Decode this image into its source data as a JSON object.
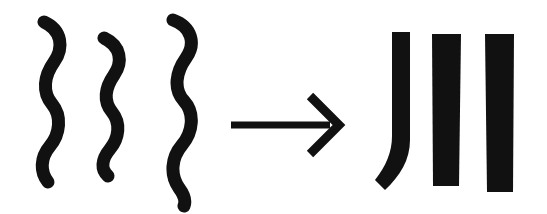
{
  "figure": {
    "title": "Wavy lines transform into straight bars",
    "background_color": "#ffffff",
    "ink_color": "#111111",
    "width": 547,
    "height": 214
  },
  "left_group": {
    "label": "Three wavy vertical lines",
    "count": 3,
    "stroke_color": "#111111",
    "items": [
      {
        "name": "wavy-line-1",
        "label": "Wavy line 1",
        "stroke_width": 13,
        "path": "M 44 22 C 62 30 64 48 54 62 C 44 76 42 92 52 104 C 62 116 60 134 50 146 C 40 158 40 172 48 182"
      },
      {
        "name": "wavy-line-2",
        "label": "Wavy line 2",
        "stroke_width": 13,
        "path": "M 104 38 C 121 46 123 62 114 75 C 105 88 103 101 112 112 C 121 123 119 138 110 149 C 101 160 101 170 108 176"
      },
      {
        "name": "wavy-line-3",
        "label": "Wavy line 3",
        "stroke_width": 13,
        "path": "M 173 20 C 192 27 196 44 186 58 C 176 72 173 89 184 101 C 195 113 193 132 182 145 C 171 158 170 175 179 188 C 185 196 186 201 184 206"
      }
    ]
  },
  "arrow": {
    "name": "transformation-arrow",
    "label": "Transformation arrow pointing right",
    "direction": "right",
    "color": "#111111",
    "shaft_width": 7,
    "head_width": 9,
    "shaft_path": "M 231 125 L 330 125",
    "head_path": "M 310 96 L 339 125 L 310 154"
  },
  "right_group": {
    "label": "Three straight vertical bars",
    "count": 3,
    "fill_color": "#111111",
    "items": [
      {
        "name": "straight-bar-1",
        "label": "Curved bar 1 (hooked at bottom)",
        "path": "M 379 32 L 410 32 L 410 140 C 410 160 400 176 385 190 L 375 180 C 386 166 392 152 392 136 L 392 32 Z"
      },
      {
        "name": "straight-bar-2",
        "label": "Straight bar 2",
        "path": "M 432 34 L 461 34 L 459 186 L 433 186 Z"
      },
      {
        "name": "straight-bar-3",
        "label": "Straight bar 3",
        "path": "M 485 34 L 514 34 L 513 192 L 487 192 Z"
      }
    ]
  }
}
